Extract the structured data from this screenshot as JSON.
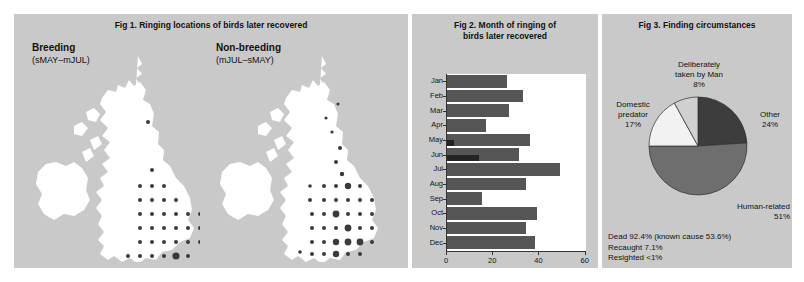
{
  "figures": {
    "fig1": {
      "title": "Fig 1. Ringing locations of birds later recovered",
      "maps": [
        {
          "name": "breeding",
          "heading": "Breeding",
          "period": "(sMAY–mJUL)"
        },
        {
          "name": "non-breeding",
          "heading": "Non-breeding",
          "period": "(mJUL–sMAY)"
        }
      ]
    },
    "fig2": {
      "title_line1": "Fig 2. Month of ringing of",
      "title_line2": "birds later recovered",
      "legend": [
        {
          "label": "Fully grown",
          "color": "#555555"
        },
        {
          "label": "Puli",
          "color": "#232323"
        }
      ]
    },
    "fig3": {
      "title": "Fig 3. Finding circumstances",
      "notes": [
        "Dead 92.4% (known cause 53.6%)",
        "Recaught 7.1%",
        "Resighted <1%"
      ]
    }
  },
  "chart_data": [
    {
      "type": "bar",
      "id": "fig2-month-of-ringing",
      "title": "Fig 2. Month of ringing of birds later recovered",
      "orientation": "horizontal",
      "xlabel": "",
      "ylabel": "",
      "xlim": [
        0,
        60
      ],
      "xticks": [
        0,
        20,
        40,
        60
      ],
      "grid": false,
      "legend_position": "top-right",
      "categories": [
        "Jan",
        "Feb",
        "Mar",
        "Apr",
        "May",
        "Jun",
        "Jul",
        "Aug",
        "Sep",
        "Oct",
        "Nov",
        "Dec"
      ],
      "series": [
        {
          "name": "Fully grown",
          "color": "#555555",
          "values": [
            26,
            33,
            27,
            17,
            36,
            31,
            49,
            34,
            15,
            39,
            34,
            38
          ]
        },
        {
          "name": "Puli",
          "color": "#232323",
          "values": [
            0,
            0,
            0,
            0,
            3,
            14,
            0,
            0,
            0,
            0,
            0,
            0
          ]
        }
      ]
    },
    {
      "type": "pie",
      "id": "fig3-finding-circumstances",
      "title": "Fig 3. Finding circumstances",
      "legend_position": "callout-labels",
      "slices": [
        {
          "label": "Other",
          "value": 24,
          "display": "24%",
          "color": "#3d3d3d"
        },
        {
          "label": "Human-related",
          "value": 51,
          "display": "51%",
          "color": "#6e6e6e"
        },
        {
          "label": "Domestic predator",
          "value": 17,
          "display": "17%",
          "color": "#f2f2f2"
        },
        {
          "label": "Deliberately taken by Man",
          "value": 8,
          "display": "8%",
          "color": "#d0d0d0"
        }
      ]
    }
  ],
  "map_dots": {
    "breeding": [
      [
        118,
        70,
        2.0
      ],
      [
        122,
        118,
        2.0
      ],
      [
        110,
        134,
        2.0
      ],
      [
        122,
        134,
        2.0
      ],
      [
        134,
        134,
        2.0
      ],
      [
        110,
        148,
        2.0
      ],
      [
        122,
        148,
        2.0
      ],
      [
        134,
        148,
        2.0
      ],
      [
        146,
        148,
        2.0
      ],
      [
        110,
        162,
        2.0
      ],
      [
        122,
        162,
        2.0
      ],
      [
        134,
        162,
        2.0
      ],
      [
        146,
        162,
        2.0
      ],
      [
        158,
        162,
        2.0
      ],
      [
        170,
        162,
        2.0
      ],
      [
        110,
        176,
        2.0
      ],
      [
        122,
        176,
        2.0
      ],
      [
        134,
        176,
        2.0
      ],
      [
        146,
        176,
        2.0
      ],
      [
        158,
        176,
        2.0
      ],
      [
        170,
        176,
        2.0
      ],
      [
        110,
        190,
        2.0
      ],
      [
        122,
        190,
        2.0
      ],
      [
        134,
        190,
        2.0
      ],
      [
        146,
        190,
        2.0
      ],
      [
        158,
        190,
        2.0
      ],
      [
        170,
        190,
        2.0
      ],
      [
        98,
        204,
        2.0
      ],
      [
        110,
        204,
        2.0
      ],
      [
        122,
        204,
        2.0
      ],
      [
        134,
        204,
        2.0
      ],
      [
        146,
        204,
        3.6
      ],
      [
        158,
        204,
        2.0
      ],
      [
        86,
        214,
        2.0
      ],
      [
        98,
        214,
        2.0
      ],
      [
        122,
        218,
        2.0
      ],
      [
        134,
        218,
        2.0
      ],
      [
        146,
        218,
        2.0
      ],
      [
        110,
        228,
        2.0
      ]
    ],
    "non-breeding": [
      [
        124,
        52,
        1.6
      ],
      [
        112,
        66,
        1.6
      ],
      [
        118,
        80,
        1.6
      ],
      [
        126,
        96,
        2.0
      ],
      [
        122,
        110,
        2.0
      ],
      [
        128,
        122,
        2.2
      ],
      [
        96,
        134,
        1.8
      ],
      [
        110,
        134,
        2.0
      ],
      [
        122,
        134,
        2.0
      ],
      [
        134,
        134,
        3.2
      ],
      [
        146,
        134,
        2.0
      ],
      [
        96,
        148,
        2.0
      ],
      [
        110,
        148,
        2.0
      ],
      [
        122,
        148,
        2.0
      ],
      [
        134,
        148,
        2.0
      ],
      [
        146,
        148,
        2.0
      ],
      [
        158,
        148,
        2.0
      ],
      [
        172,
        148,
        1.8
      ],
      [
        98,
        162,
        2.0
      ],
      [
        110,
        162,
        2.0
      ],
      [
        122,
        162,
        3.4
      ],
      [
        134,
        162,
        2.0
      ],
      [
        146,
        162,
        2.0
      ],
      [
        158,
        162,
        2.0
      ],
      [
        98,
        176,
        2.0
      ],
      [
        110,
        176,
        2.0
      ],
      [
        122,
        176,
        2.0
      ],
      [
        134,
        176,
        3.4
      ],
      [
        146,
        176,
        2.0
      ],
      [
        158,
        176,
        2.0
      ],
      [
        98,
        190,
        2.0
      ],
      [
        110,
        190,
        2.0
      ],
      [
        122,
        190,
        3.2
      ],
      [
        134,
        190,
        3.4
      ],
      [
        146,
        190,
        3.4
      ],
      [
        158,
        190,
        2.0
      ],
      [
        86,
        200,
        1.8
      ],
      [
        98,
        202,
        2.0
      ],
      [
        110,
        202,
        2.0
      ],
      [
        122,
        202,
        3.2
      ],
      [
        134,
        202,
        2.0
      ],
      [
        146,
        202,
        2.0
      ],
      [
        92,
        214,
        1.8
      ],
      [
        110,
        216,
        2.0
      ],
      [
        122,
        216,
        2.0
      ],
      [
        134,
        216,
        2.0
      ],
      [
        88,
        228,
        1.8
      ],
      [
        110,
        230,
        2.0
      ]
    ]
  }
}
